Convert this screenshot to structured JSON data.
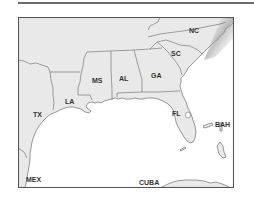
{
  "map": {
    "title": "",
    "colors": {
      "land": "#e9e9e9",
      "water": "#ffffff",
      "border": "#6e6e6e",
      "frame": "#555555",
      "rule": "#6a6a6a",
      "label": "#333333"
    },
    "labels": {
      "nc": "NC",
      "sc": "SC",
      "ga": "GA",
      "al": "AL",
      "ms": "MS",
      "la": "LA",
      "tx": "TX",
      "fl": "FL",
      "bah": "BAH",
      "mex": "MEX",
      "cuba": "CUBA"
    },
    "regions": [
      "NC",
      "SC",
      "GA",
      "AL",
      "MS",
      "LA",
      "TX",
      "FL",
      "BAH",
      "MEX",
      "CUBA"
    ]
  }
}
